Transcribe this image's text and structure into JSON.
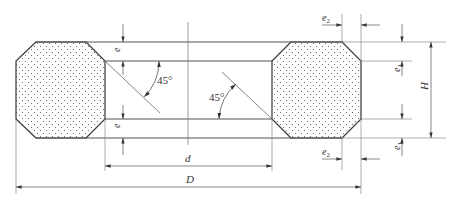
{
  "colors": {
    "outline": "#444444",
    "thin": "#666666",
    "dots": "#555555",
    "background": "#ffffff"
  },
  "labels": {
    "e_top": "e",
    "e_bottom": "e",
    "e1_top": "e",
    "e1_top_sub": "1",
    "e1_bottom": "e",
    "e1_bottom_sub": "1",
    "e2_top": "e",
    "e2_top_sub": "2",
    "e2_bottom": "e",
    "e2_bottom_sub": "2",
    "H": "H",
    "d": "d",
    "D": "D",
    "angle_left": "45°",
    "angle_right": "45°"
  }
}
